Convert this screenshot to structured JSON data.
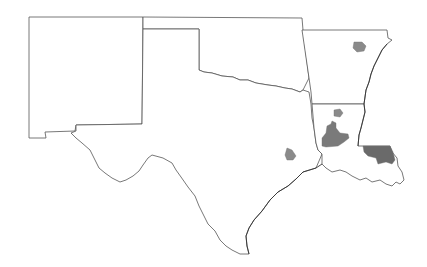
{
  "map": {
    "title": "",
    "states": [
      {
        "id": "new-mexico",
        "name": "New Mexico"
      },
      {
        "id": "oklahoma",
        "name": "Oklahoma"
      },
      {
        "id": "texas",
        "name": "Texas"
      },
      {
        "id": "arkansas",
        "name": "Arkansas"
      },
      {
        "id": "louisiana",
        "name": "Louisiana"
      }
    ],
    "highlighted_regions": [
      {
        "id": "arkansas-north-central",
        "state": "Arkansas",
        "color": "#8a8a8a"
      },
      {
        "id": "arkansas-south",
        "state": "Arkansas",
        "color": "#8a8a8a"
      },
      {
        "id": "louisiana-central",
        "state": "Louisiana",
        "color": "#7a7a7a"
      },
      {
        "id": "louisiana-southeast",
        "state": "Louisiana",
        "color": "#6a6a6a"
      },
      {
        "id": "texas-east",
        "state": "Texas",
        "color": "#8a8a8a"
      }
    ],
    "colors": {
      "background": "#ffffff",
      "border": "#555555",
      "highlight": "#808080"
    }
  }
}
